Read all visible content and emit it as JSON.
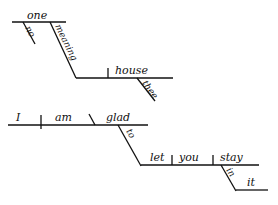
{
  "diagram_1": {
    "subject": "one",
    "subject_modifier": "no",
    "participle": "meaning",
    "object": "house",
    "object_modifier": "thee"
  },
  "diagram_2": {
    "subject": "I",
    "verb": "am",
    "predicate_adjective": "glad",
    "infinitive_marker": "to",
    "infinitive_verb": "let",
    "object": "you",
    "complement": "stay",
    "preposition": "in",
    "prep_object": "it"
  },
  "colors": {
    "ink": "#111111",
    "background": "#ffffff"
  }
}
